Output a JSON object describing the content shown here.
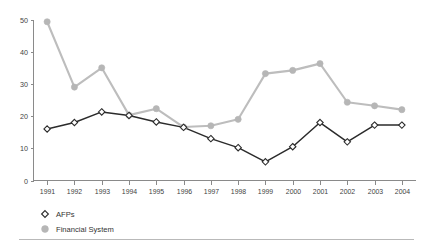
{
  "chart_data": {
    "type": "line",
    "title": "",
    "subtitle": "",
    "xlabel": "",
    "ylabel": "",
    "categories": [
      "1991",
      "1992",
      "1993",
      "1994",
      "1995",
      "1996",
      "1997",
      "1998",
      "1999",
      "2000",
      "2001",
      "2002",
      "2003",
      "2004"
    ],
    "ylim": [
      0,
      50
    ],
    "yticks": [
      0,
      10,
      20,
      30,
      40,
      50
    ],
    "grid": false,
    "legend_position": "bottom-left",
    "series": [
      {
        "name": "AFPs",
        "marker": "open-diamond",
        "color": "#2b2b2b",
        "values": [
          16.0,
          18.0,
          21.3,
          20.2,
          18.2,
          16.5,
          13.0,
          10.2,
          5.8,
          10.5,
          18.0,
          12.0,
          17.2,
          17.2
        ]
      },
      {
        "name": "Financial System",
        "marker": "filled-circle",
        "color": "#b6b6b6",
        "values": [
          49.3,
          29.0,
          35.0,
          20.3,
          22.3,
          16.6,
          17.0,
          19.0,
          33.2,
          34.2,
          36.3,
          24.3,
          23.2,
          22.0
        ]
      }
    ]
  },
  "axes": {
    "y_tick_labels": [
      "50",
      "40",
      "30",
      "20",
      "10",
      "0"
    ],
    "x_tick_labels": [
      "1991",
      "1992",
      "1993",
      "1994",
      "1995",
      "1996",
      "1997",
      "1998",
      "1999",
      "2000",
      "2001",
      "2002",
      "2003",
      "2004"
    ]
  },
  "legend": {
    "entries": [
      {
        "label": "AFPs",
        "marker_icon": "open-diamond-marker-icon",
        "color": "#2b2b2b"
      },
      {
        "label": "Financial System",
        "marker_icon": "filled-circle-marker-icon",
        "color": "#b6b6b6"
      }
    ]
  }
}
